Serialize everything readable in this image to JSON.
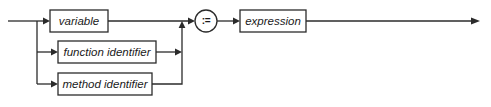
{
  "diagram": {
    "type": "railroad-syntax-diagram",
    "canvas": {
      "width": 491,
      "height": 107,
      "background": "#ffffff"
    },
    "ink_color": "#2b2b2b",
    "nodes": [
      {
        "id": "variable",
        "kind": "nonterminal-box",
        "label": "variable",
        "x": 50,
        "y": 10,
        "w": 58,
        "h": 22
      },
      {
        "id": "function-identifier",
        "kind": "nonterminal-box",
        "label": "function identifier",
        "x": 58,
        "y": 41,
        "w": 98,
        "h": 22
      },
      {
        "id": "method-identifier",
        "kind": "nonterminal-box",
        "label": "method identifier",
        "x": 58,
        "y": 73,
        "w": 94,
        "h": 22
      },
      {
        "id": "assign-operator",
        "kind": "terminal-circle",
        "label": ":=",
        "cx": 206,
        "cy": 21,
        "r": 11
      },
      {
        "id": "expression",
        "kind": "nonterminal-box",
        "label": "expression",
        "x": 240,
        "y": 10,
        "w": 66,
        "h": 22
      }
    ],
    "rails": {
      "entry_x": 8,
      "branch_x": 37,
      "merge_x": 182,
      "main_y": 21,
      "branch_bottom_y": 84,
      "exit_x": 480
    }
  }
}
